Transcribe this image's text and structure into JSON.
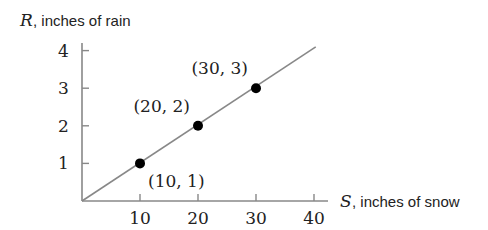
{
  "chart_data": {
    "type": "line",
    "title": "",
    "xlabel": {
      "var": "S",
      "text": ", inches of snow"
    },
    "ylabel": {
      "var": "R",
      "text": ", inches of rain"
    },
    "xlim": [
      0,
      40
    ],
    "ylim": [
      0,
      4
    ],
    "x_ticks": [
      10,
      20,
      30,
      40
    ],
    "y_ticks": [
      1,
      2,
      3,
      4
    ],
    "grid": false,
    "legend": null,
    "series": [
      {
        "name": "R = S/10",
        "line": {
          "from": [
            0,
            0
          ],
          "to": [
            40.3,
            4.1
          ]
        },
        "points": [
          {
            "x": 10,
            "y": 1,
            "label": "(10, 1)"
          },
          {
            "x": 20,
            "y": 2,
            "label": "(20, 2)"
          },
          {
            "x": 30,
            "y": 3,
            "label": "(30, 3)"
          }
        ]
      }
    ],
    "colors": {
      "axis": "#888888",
      "line": "#888888",
      "point": "#000000",
      "text": "#222222"
    }
  }
}
